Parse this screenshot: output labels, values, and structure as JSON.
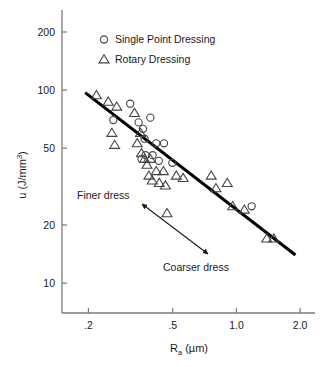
{
  "chart_data": {
    "type": "scatter",
    "title": "",
    "xlabel": "Ra (µm)",
    "ylabel": "u (J/mm3)",
    "xlabel_base": "R",
    "xlabel_sub": "a",
    "xlabel_unit": " (µm)",
    "ylabel_base": "u (J/mm",
    "ylabel_sup": "3",
    "ylabel_close": ")",
    "xscale": "log",
    "yscale": "log",
    "xlim": [
      0.15,
      2.35
    ],
    "ylim": [
      7.0,
      260.0
    ],
    "grid": false,
    "legend_position": "top-center",
    "xticks": [
      0.2,
      0.5,
      1.0,
      2.0
    ],
    "xtick_labels": [
      ".2",
      ".5",
      "1.0",
      "2.0"
    ],
    "yticks": [
      10,
      20,
      50,
      100,
      200
    ],
    "ytick_labels": [
      "10",
      "20",
      "50",
      "100",
      "200"
    ],
    "series": [
      {
        "name": "Single Point Dressing",
        "marker": "circle",
        "points": [
          [
            0.262,
            70.0
          ],
          [
            0.315,
            85.0
          ],
          [
            0.345,
            68.0
          ],
          [
            0.362,
            63.0
          ],
          [
            0.392,
            72.0
          ],
          [
            0.368,
            56.0
          ],
          [
            0.356,
            44.0
          ],
          [
            0.372,
            46.0
          ],
          [
            0.402,
            46.0
          ],
          [
            0.418,
            53.0
          ],
          [
            0.43,
            43.0
          ],
          [
            0.455,
            53.0
          ],
          [
            0.498,
            42.0
          ],
          [
            1.18,
            25.0
          ]
        ]
      },
      {
        "name": "Rotary Dressing",
        "marker": "triangle",
        "points": [
          [
            0.218,
            94.0
          ],
          [
            0.248,
            87.0
          ],
          [
            0.272,
            82.0
          ],
          [
            0.258,
            60.0
          ],
          [
            0.266,
            52.0
          ],
          [
            0.33,
            76.0
          ],
          [
            0.352,
            60.0
          ],
          [
            0.34,
            53.0
          ],
          [
            0.356,
            47.0
          ],
          [
            0.368,
            44.0
          ],
          [
            0.378,
            41.0
          ],
          [
            0.392,
            44.0
          ],
          [
            0.386,
            36.0
          ],
          [
            0.4,
            34.0
          ],
          [
            0.418,
            38.0
          ],
          [
            0.432,
            33.0
          ],
          [
            0.452,
            38.0
          ],
          [
            0.462,
            32.0
          ],
          [
            0.47,
            23.0
          ],
          [
            0.52,
            36.0
          ],
          [
            0.56,
            35.0
          ],
          [
            0.76,
            36.0
          ],
          [
            0.8,
            31.0
          ],
          [
            0.905,
            33.0
          ],
          [
            0.96,
            25.0
          ],
          [
            1.09,
            24.0
          ],
          [
            1.39,
            17.0
          ],
          [
            1.5,
            17.0
          ]
        ]
      }
    ],
    "trendline": {
      "name": "fit-line",
      "x_start": 0.193,
      "y_start": 97.0,
      "x_end": 1.9,
      "y_end": 14.0
    },
    "annotations": [
      {
        "name": "finer-dress",
        "text": "Finer dress",
        "x_px": 77,
        "y_px": 199
      },
      {
        "name": "coarser-dress",
        "text": "Coarser dress",
        "x_px": 163,
        "y_px": 271
      }
    ],
    "arrow": {
      "name": "dress-direction-arrow",
      "x1_px": 142,
      "y1_px": 204,
      "x2_px": 208,
      "y2_px": 254,
      "double_headed": true
    }
  },
  "legend": {
    "entries": [
      {
        "label": "Single Point Dressing",
        "marker": "circle"
      },
      {
        "label": "Rotary Dressing",
        "marker": "triangle"
      }
    ]
  },
  "colors": {
    "ink": "#1a1a1a",
    "axis": "#7a7a7a",
    "marker": "#444444",
    "trendline": "#000000",
    "background": "#ffffff"
  }
}
